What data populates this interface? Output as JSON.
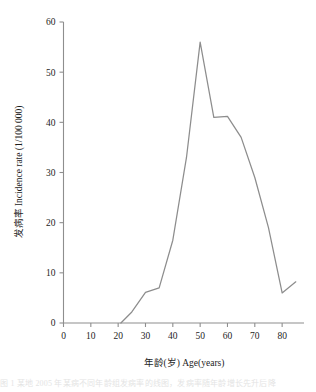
{
  "chart_data": {
    "type": "line",
    "title": "",
    "xlabel": "年龄(岁) Age(years)",
    "ylabel": "发病率 Incidence rate (1/100 000)",
    "xlim": [
      0,
      88
    ],
    "ylim": [
      0,
      60
    ],
    "grid": false,
    "legend": "none",
    "xticks": [
      0,
      10,
      20,
      30,
      40,
      50,
      60,
      70,
      80
    ],
    "xtick_labels": [
      "0",
      "10",
      "20",
      "30",
      "40",
      "50",
      "60",
      "70",
      "80"
    ],
    "yticks": [
      0,
      10,
      20,
      30,
      40,
      50,
      60
    ],
    "ytick_labels": [
      "0",
      "10",
      "20",
      "30",
      "40",
      "50",
      "60"
    ],
    "series": [
      {
        "name": "Incidence rate",
        "color": "#8d8d8d",
        "x": [
          21,
          25,
          30,
          35,
          40,
          45,
          50,
          55,
          60,
          65,
          70,
          75,
          80,
          85
        ],
        "values": [
          0.0,
          2.2,
          6.1,
          7.0,
          16.5,
          33.0,
          56.0,
          41.0,
          41.2,
          37.0,
          29.0,
          19.0,
          6.0,
          8.2
        ]
      }
    ]
  },
  "axes": {
    "y_axis_name": "y-axis",
    "x_axis_name": "x-axis"
  },
  "caption": {
    "text": "图 1  某地 2005 年某病不同年龄组发病率的线图，发病率随年龄增长先升后降"
  }
}
